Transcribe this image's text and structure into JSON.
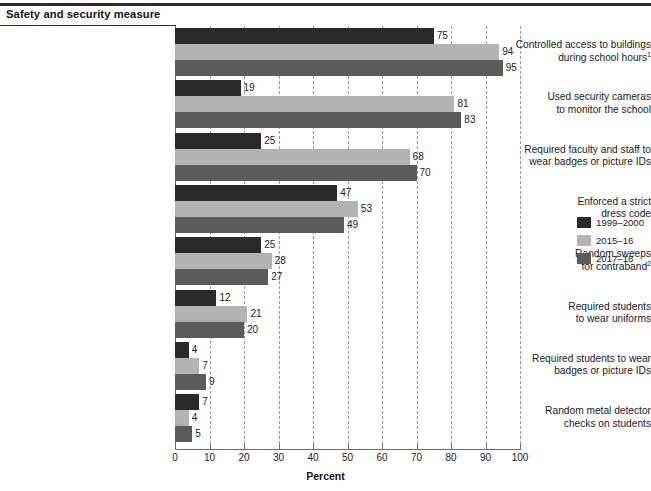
{
  "header": {
    "title": "Safety and security measure"
  },
  "axis": {
    "xlabel": "Percent",
    "ticks": [
      "0",
      "10",
      "20",
      "30",
      "40",
      "50",
      "60",
      "70",
      "80",
      "90",
      "100"
    ]
  },
  "legend": {
    "items": [
      {
        "label": "1999–2000",
        "color": "#2a2a2a"
      },
      {
        "label": "2015–16",
        "color": "#b3b3b3"
      },
      {
        "label": "2017–18",
        "color": "#5b5b5b"
      }
    ]
  },
  "chart_data": {
    "type": "bar",
    "orientation": "horizontal",
    "title": "Safety and security measure",
    "xlabel": "Percent",
    "ylabel": "",
    "xlim": [
      0,
      100
    ],
    "grid": "vertical-dashed",
    "legend_position": "right",
    "categories": [
      "Controlled access to buildings during school hours¹",
      "Used security cameras to monitor the school",
      "Required faculty and staff to wear badges or picture IDs",
      "Enforced a strict dress code",
      "Random sweeps for contraband²",
      "Required students to wear uniforms",
      "Required students to wear badges or picture IDs",
      "Random metal detector checks on students"
    ],
    "category_lines": [
      [
        "Controlled access to buildings",
        "during school hours¹"
      ],
      [
        "Used security cameras",
        "to monitor the school"
      ],
      [
        "Required faculty and staff to",
        "wear badges or picture IDs"
      ],
      [
        "Enforced a strict",
        "dress code"
      ],
      [
        "Random sweeps",
        "for contraband²"
      ],
      [
        "Required students",
        "to wear uniforms"
      ],
      [
        "Required students to wear",
        "badges or picture IDs"
      ],
      [
        "Random metal detector",
        "checks on students"
      ]
    ],
    "series": [
      {
        "name": "1999–2000",
        "color": "#2a2a2a",
        "values": [
          75,
          19,
          25,
          47,
          25,
          12,
          4,
          7
        ]
      },
      {
        "name": "2015–16",
        "color": "#b3b3b3",
        "values": [
          94,
          81,
          68,
          53,
          28,
          21,
          7,
          4
        ]
      },
      {
        "name": "2017–18",
        "color": "#5b5b5b",
        "values": [
          95,
          83,
          70,
          49,
          27,
          20,
          9,
          5
        ]
      }
    ]
  }
}
